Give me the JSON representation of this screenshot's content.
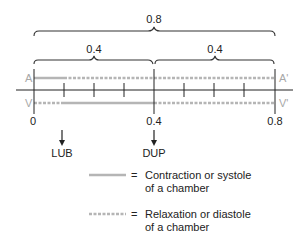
{
  "diagram": {
    "brackets": {
      "total": {
        "label": "0.8"
      },
      "first_half": {
        "label": "0.4"
      },
      "second_half": {
        "label": "0.4"
      }
    },
    "rows": {
      "atria": {
        "left_label": "A",
        "right_label": "A'"
      },
      "ventricles": {
        "left_label": "V",
        "right_label": "V'"
      }
    },
    "axis": {
      "ticks": [
        "0",
        "0.4",
        "0.8"
      ],
      "minor_ticks_per_half": 3
    },
    "sounds": [
      {
        "label": "LUB",
        "at": "0.1"
      },
      {
        "label": "DUP",
        "at": "0.4"
      }
    ],
    "legend": [
      {
        "style": "solid",
        "equals": "=",
        "line1": "Contraction or systole",
        "line2": "of a chamber"
      },
      {
        "style": "dashed",
        "equals": "=",
        "line1": "Relaxation or diastole",
        "line2": "of a chamber"
      }
    ],
    "colors": {
      "line": "#b5b5b5",
      "ink": "#222222"
    }
  }
}
